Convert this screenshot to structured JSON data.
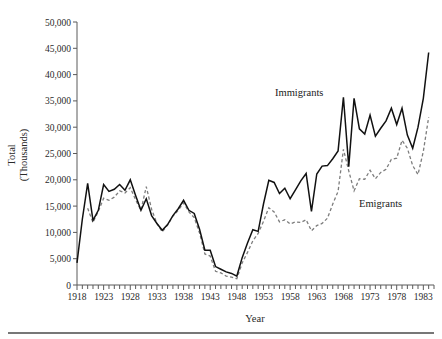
{
  "chart_data": {
    "type": "line",
    "title": "",
    "xlabel": "Year",
    "ylabel": "Total (Thousands)",
    "ylabel_line1": "Total",
    "ylabel_line2": "(Thousands)",
    "grid": false,
    "legend_position": "inline-annotation",
    "xlim": [
      1918,
      1985
    ],
    "ylim": [
      0,
      50000
    ],
    "ytick_labels": [
      "50,000",
      "45,000",
      "40,000",
      "35,000",
      "30,000",
      "25,000",
      "20,000",
      "15,000",
      "10,000",
      "5,000",
      "0"
    ],
    "ytick_values": [
      50000,
      45000,
      40000,
      35000,
      30000,
      25000,
      20000,
      15000,
      10000,
      5000,
      0
    ],
    "xtick_labels": [
      "1918",
      "1923",
      "1928",
      "1933",
      "1938",
      "1943",
      "1948",
      "1953",
      "1958",
      "1963",
      "1968",
      "1973",
      "1978",
      "1983"
    ],
    "xtick_values": [
      1918,
      1923,
      1928,
      1933,
      1938,
      1943,
      1948,
      1953,
      1958,
      1963,
      1968,
      1973,
      1978,
      1983
    ],
    "minor_xticks_interval": 1,
    "series": [
      {
        "name": "Immigrants",
        "style": "solid",
        "color": "#111111",
        "x": [
          1918,
          1919,
          1920,
          1921,
          1922,
          1923,
          1924,
          1925,
          1926,
          1927,
          1928,
          1929,
          1930,
          1931,
          1932,
          1933,
          1934,
          1935,
          1936,
          1937,
          1938,
          1939,
          1940,
          1941,
          1942,
          1943,
          1944,
          1945,
          1946,
          1947,
          1948,
          1949,
          1950,
          1951,
          1952,
          1953,
          1954,
          1955,
          1956,
          1957,
          1958,
          1959,
          1960,
          1961,
          1962,
          1963,
          1964,
          1965,
          1966,
          1967,
          1968,
          1969,
          1970,
          1971,
          1972,
          1973,
          1974,
          1975,
          1976,
          1977,
          1978,
          1979,
          1980,
          1981,
          1982,
          1983,
          1984
        ],
        "values": [
          4200,
          12500,
          19300,
          12300,
          14200,
          19100,
          17800,
          18200,
          19100,
          18000,
          20000,
          17000,
          14200,
          16400,
          13200,
          11700,
          10400,
          11500,
          13200,
          14500,
          16100,
          14200,
          13600,
          10600,
          6600,
          6600,
          3500,
          3000,
          2500,
          2200,
          1700,
          5200,
          8000,
          10500,
          10200,
          15400,
          19900,
          19500,
          17400,
          18400,
          16400,
          18100,
          19800,
          21200,
          14000,
          21100,
          22600,
          22700,
          24000,
          25500,
          35700,
          22500,
          35500,
          29700,
          28700,
          32300,
          28300,
          29800,
          31200,
          33600,
          30500,
          33600,
          28500,
          26000,
          30000,
          35500,
          44200
        ]
      },
      {
        "name": "Emigrants",
        "style": "dashed",
        "color": "#7d7d7d",
        "x": [
          1920,
          1921,
          1922,
          1923,
          1924,
          1925,
          1926,
          1927,
          1928,
          1929,
          1930,
          1931,
          1932,
          1933,
          1934,
          1935,
          1936,
          1937,
          1938,
          1939,
          1940,
          1941,
          1942,
          1943,
          1944,
          1945,
          1946,
          1947,
          1948,
          1949,
          1950,
          1951,
          1952,
          1953,
          1954,
          1955,
          1956,
          1957,
          1958,
          1959,
          1960,
          1961,
          1962,
          1963,
          1964,
          1965,
          1966,
          1967,
          1968,
          1969,
          1970,
          1971,
          1972,
          1973,
          1974,
          1975,
          1976,
          1977,
          1978,
          1979,
          1980,
          1981,
          1982,
          1983,
          1984
        ],
        "values": [
          14600,
          11900,
          14000,
          16500,
          16100,
          16700,
          17900,
          17500,
          18500,
          16200,
          14200,
          18700,
          14400,
          11700,
          10100,
          11400,
          13100,
          14200,
          15600,
          13900,
          12800,
          9900,
          5900,
          5500,
          2600,
          2300,
          1700,
          1500,
          1200,
          4200,
          6200,
          8400,
          9800,
          12100,
          14700,
          13900,
          12000,
          12400,
          11600,
          12000,
          11900,
          12400,
          10300,
          11300,
          11700,
          12700,
          15400,
          17800,
          25800,
          21700,
          17900,
          20200,
          20100,
          21800,
          20200,
          21400,
          22000,
          23900,
          24100,
          27500,
          26000,
          22700,
          21000,
          25400,
          31900
        ]
      }
    ],
    "annotations": [
      {
        "text": "Immigrants",
        "x_approx": 1961,
        "y_approx": 37500
      },
      {
        "text": "Emigrants",
        "x_approx": 1975,
        "y_approx": 19500
      }
    ]
  }
}
